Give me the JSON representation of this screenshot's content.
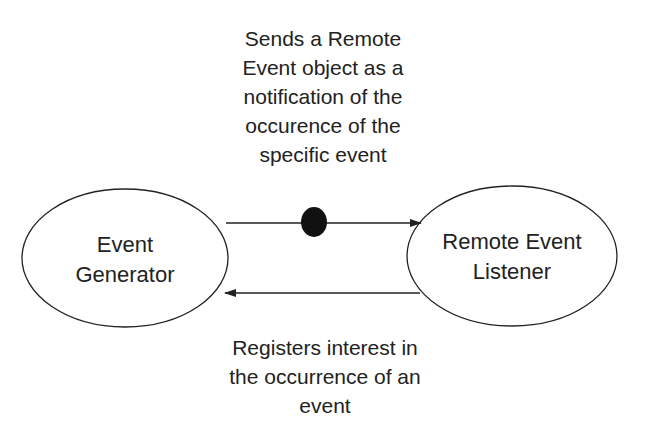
{
  "nodes": {
    "generator": {
      "label": "Event\nGenerator"
    },
    "listener": {
      "label": "Remote Event\nListener"
    }
  },
  "edges": {
    "notify": {
      "label": "Sends a Remote\nEvent object as a\nnotification of the\noccurence of the\nspecific event"
    },
    "register": {
      "label": "Registers interest in\nthe occurrence of an\nevent"
    }
  },
  "colors": {
    "stroke": "#222222",
    "dot": "#111111",
    "background": "#ffffff"
  }
}
